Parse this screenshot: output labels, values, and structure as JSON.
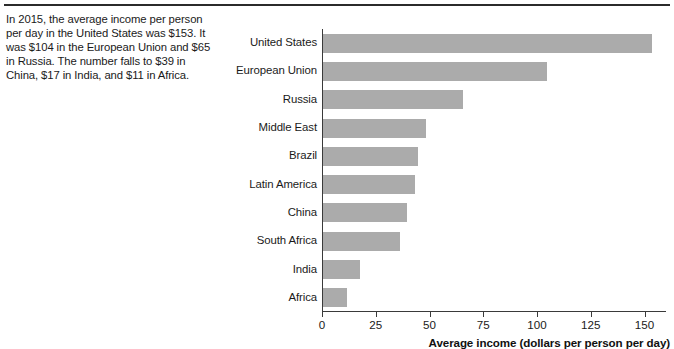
{
  "figure": {
    "caption": "In 2015, the average income per person per day in the United States was $153. It was $104 in the European Union and $65 in Russia. The number falls to $39 in China, $17 in India, and $11 in Africa."
  },
  "chart_data": {
    "type": "bar",
    "orientation": "horizontal",
    "title": "",
    "subtitle": "",
    "xlabel": "Average income (dollars per person per day)",
    "ylabel": "",
    "categories": [
      "United States",
      "European Union",
      "Russia",
      "Middle East",
      "Brazil",
      "Latin America",
      "China",
      "South Africa",
      "India",
      "Africa"
    ],
    "values": [
      153,
      104,
      65,
      48,
      44,
      43,
      39,
      36,
      17,
      11
    ],
    "xlim": [
      0,
      160
    ],
    "xticks": [
      0,
      25,
      50,
      75,
      100,
      125,
      150
    ],
    "xticklabels": [
      "0",
      "25",
      "50",
      "75",
      "100",
      "125",
      "150"
    ],
    "grid": false,
    "legend": false,
    "bar_color": "#ababab",
    "axis_color": "#3a3a3a"
  }
}
